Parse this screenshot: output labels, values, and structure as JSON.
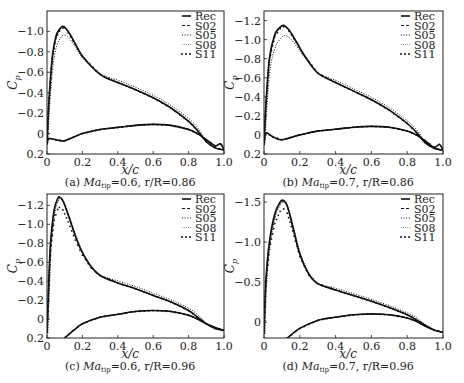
{
  "figure": {
    "panels": [
      {
        "id": "a",
        "caption_prefix": "(a) ",
        "caption_ma": "Ma",
        "caption_sub": "tip",
        "caption_rest": "=0.6, r/R=0.86",
        "frame": {
          "x0": 47,
          "y0": 11,
          "x1": 224,
          "y1": 154
        },
        "ylim": [
          0.2,
          -1.2
        ],
        "yticks": [
          -1.0,
          -0.8,
          -0.6,
          -0.4,
          -0.2,
          0,
          0.2
        ],
        "ytick_labels": [
          "−1.0",
          "−0.8",
          "−0.6",
          "−0.4",
          "−0.2",
          "0",
          "0.2"
        ]
      },
      {
        "id": "b",
        "caption_prefix": "(b) ",
        "caption_ma": "Ma",
        "caption_sub": "tip",
        "caption_rest": "=0.7, r/R=0.86",
        "frame": {
          "x0": 264,
          "y0": 11,
          "x1": 443,
          "y1": 154
        },
        "ylim": [
          0.2,
          -1.3
        ],
        "yticks": [
          -1.2,
          -1.0,
          -0.8,
          -0.6,
          -0.4,
          -0.2,
          0,
          0.2
        ],
        "ytick_labels": [
          "−1.2",
          "−1.0",
          "−0.8",
          "−0.6",
          "−0.4",
          "−0.2",
          "0",
          "0.2"
        ]
      },
      {
        "id": "c",
        "caption_prefix": "(c) ",
        "caption_ma": "Ma",
        "caption_sub": "tip",
        "caption_rest": "=0.6, r/R=0.96",
        "frame": {
          "x0": 47,
          "y0": 194,
          "x1": 224,
          "y1": 338
        },
        "ylim": [
          0.2,
          -1.32
        ],
        "yticks": [
          -1.2,
          -1.0,
          -0.8,
          -0.6,
          -0.4,
          -0.2,
          0,
          0.2
        ],
        "ytick_labels": [
          "−1.2",
          "−1.0",
          "−0.8",
          "−0.6",
          "−0.4",
          "−0.2",
          "0",
          "0.2"
        ]
      },
      {
        "id": "d",
        "caption_prefix": "(d) ",
        "caption_ma": "Ma",
        "caption_sub": "tip",
        "caption_rest": "=0.7, r/R=0.96",
        "frame": {
          "x0": 264,
          "y0": 194,
          "x1": 443,
          "y1": 338
        },
        "ylim": [
          0.2,
          -1.6
        ],
        "yticks": [
          -1.5,
          -1.0,
          -0.5,
          0
        ],
        "ytick_labels": [
          "−1.5",
          "−1.0",
          "−0.5",
          "0"
        ]
      }
    ],
    "xticks": [
      0,
      0.2,
      0.4,
      0.6,
      0.8,
      1.0
    ],
    "xtick_labels": [
      "0",
      "0.2",
      "0.4",
      "0.6",
      "0.8",
      "1.0"
    ],
    "xlabel": "x/c",
    "ylabel_main": "C",
    "ylabel_sub": "p",
    "legend": [
      "Rec",
      "S02",
      "S05",
      "S08",
      "S11"
    ]
  },
  "chart_data": [
    {
      "type": "line",
      "title": "(a) Ma_tip=0.6, r/R=0.86",
      "xlabel": "x/c",
      "ylabel": "C_p",
      "xlim": [
        0,
        1.0
      ],
      "ylim": [
        0.2,
        -1.2
      ],
      "y_inverted": true,
      "grid": false,
      "legend_position": "upper right",
      "legend": [
        "Rec",
        "S02",
        "S05",
        "S08",
        "S11"
      ],
      "series": [
        {
          "name": "Rec",
          "style": "solid",
          "suction_side": {
            "x": [
              0,
              0.01,
              0.03,
              0.05,
              0.07,
              0.09,
              0.12,
              0.16,
              0.2,
              0.3,
              0.4,
              0.5,
              0.6,
              0.7,
              0.8,
              0.85,
              0.9,
              0.95,
              1.0
            ],
            "y": [
              0.1,
              -0.3,
              -0.75,
              -0.95,
              -1.02,
              -1.05,
              -1.0,
              -0.88,
              -0.76,
              -0.58,
              -0.5,
              -0.43,
              -0.35,
              -0.25,
              -0.12,
              -0.03,
              0.08,
              0.14,
              0.16
            ]
          },
          "pressure_side": {
            "x": [
              0,
              0.01,
              0.05,
              0.1,
              0.2,
              0.3,
              0.4,
              0.5,
              0.6,
              0.7,
              0.8,
              0.85,
              0.9,
              0.95,
              0.98,
              1.0
            ],
            "y": [
              0.1,
              0.05,
              0.06,
              0.07,
              0.0,
              -0.04,
              -0.06,
              -0.08,
              -0.09,
              -0.08,
              -0.04,
              0.0,
              0.06,
              0.12,
              0.1,
              0.16
            ]
          }
        },
        {
          "name": "S02",
          "style": "dashed",
          "peak_cp": -1.04
        },
        {
          "name": "S05",
          "style": "dotted",
          "peak_cp": -0.95
        },
        {
          "name": "S08",
          "style": "fine-dotted",
          "peak_cp": -1.04
        },
        {
          "name": "S11",
          "style": "dot-markers",
          "peak_cp": -1.03
        }
      ]
    },
    {
      "type": "line",
      "title": "(b) Ma_tip=0.7, r/R=0.86",
      "xlabel": "x/c",
      "ylabel": "C_p",
      "xlim": [
        0,
        1.0
      ],
      "ylim": [
        0.2,
        -1.3
      ],
      "y_inverted": true,
      "grid": false,
      "legend_position": "upper right",
      "legend": [
        "Rec",
        "S02",
        "S05",
        "S08",
        "S11"
      ],
      "series": [
        {
          "name": "Rec",
          "style": "solid",
          "suction_side": {
            "x": [
              0,
              0.01,
              0.03,
              0.06,
              0.09,
              0.11,
              0.14,
              0.18,
              0.22,
              0.3,
              0.4,
              0.5,
              0.6,
              0.7,
              0.8,
              0.85,
              0.9,
              0.95,
              1.0
            ],
            "y": [
              0.1,
              -0.3,
              -0.8,
              -1.05,
              -1.13,
              -1.15,
              -1.1,
              -0.98,
              -0.85,
              -0.65,
              -0.55,
              -0.46,
              -0.37,
              -0.26,
              -0.12,
              -0.03,
              0.08,
              0.14,
              0.16
            ]
          },
          "pressure_side": {
            "x": [
              0,
              0.01,
              0.05,
              0.1,
              0.2,
              0.3,
              0.4,
              0.5,
              0.6,
              0.7,
              0.8,
              0.85,
              0.9,
              0.95,
              0.98,
              1.0
            ],
            "y": [
              0.1,
              -0.02,
              0.02,
              0.05,
              0.0,
              -0.04,
              -0.06,
              -0.08,
              -0.09,
              -0.08,
              -0.04,
              0.0,
              0.06,
              0.13,
              0.1,
              0.16
            ]
          }
        },
        {
          "name": "S02",
          "style": "dashed",
          "peak_cp": -1.14
        },
        {
          "name": "S05",
          "style": "dotted",
          "peak_cp": -1.01
        },
        {
          "name": "S08",
          "style": "fine-dotted",
          "peak_cp": -1.14
        },
        {
          "name": "S11",
          "style": "dot-markers",
          "peak_cp": -1.13
        }
      ]
    },
    {
      "type": "line",
      "title": "(c) Ma_tip=0.6, r/R=0.96",
      "xlabel": "x/c",
      "ylabel": "C_p",
      "xlim": [
        0,
        1.0
      ],
      "ylim": [
        0.2,
        -1.32
      ],
      "y_inverted": true,
      "grid": false,
      "legend_position": "upper right",
      "legend": [
        "Rec",
        "S02",
        "S05",
        "S08",
        "S11"
      ],
      "series": [
        {
          "name": "Rec",
          "style": "solid",
          "suction_side": {
            "x": [
              0,
              0.01,
              0.02,
              0.04,
              0.06,
              0.07,
              0.09,
              0.12,
              0.16,
              0.2,
              0.25,
              0.3,
              0.4,
              0.5,
              0.6,
              0.7,
              0.8,
              0.85,
              0.9,
              0.95,
              1.0
            ],
            "y": [
              0.15,
              -0.4,
              -0.8,
              -1.15,
              -1.27,
              -1.29,
              -1.25,
              -1.1,
              -0.88,
              -0.7,
              -0.55,
              -0.46,
              -0.38,
              -0.32,
              -0.25,
              -0.18,
              -0.09,
              -0.02,
              0.05,
              0.1,
              0.12
            ]
          },
          "pressure_side": {
            "x": [
              0.1,
              0.15,
              0.2,
              0.3,
              0.4,
              0.5,
              0.6,
              0.7,
              0.8,
              0.85,
              0.9,
              0.95,
              1.0
            ],
            "y": [
              0.2,
              0.12,
              0.05,
              -0.02,
              -0.05,
              -0.08,
              -0.09,
              -0.08,
              -0.04,
              0.0,
              0.05,
              0.09,
              0.12
            ]
          }
        },
        {
          "name": "S02",
          "style": "dashed",
          "peak_cp": -1.28
        },
        {
          "name": "S05",
          "style": "dotted",
          "peak_cp": -1.27
        },
        {
          "name": "S08",
          "style": "fine-dotted",
          "peak_cp": -1.27
        },
        {
          "name": "S11",
          "style": "dot-markers",
          "peak_cp": -1.17
        }
      ]
    },
    {
      "type": "line",
      "title": "(d) Ma_tip=0.7, r/R=0.96",
      "xlabel": "x/c",
      "ylabel": "C_p",
      "xlim": [
        0,
        1.0
      ],
      "ylim": [
        0.2,
        -1.6
      ],
      "y_inverted": true,
      "grid": false,
      "legend_position": "upper right",
      "legend": [
        "Rec",
        "S02",
        "S05",
        "S08",
        "S11"
      ],
      "series": [
        {
          "name": "Rec",
          "style": "solid",
          "suction_side": {
            "x": [
              0,
              0.01,
              0.03,
              0.06,
              0.09,
              0.11,
              0.13,
              0.16,
              0.2,
              0.25,
              0.3,
              0.4,
              0.5,
              0.6,
              0.7,
              0.8,
              0.85,
              0.9,
              0.95,
              1.0
            ],
            "y": [
              0.15,
              -0.5,
              -1.0,
              -1.35,
              -1.5,
              -1.52,
              -1.45,
              -1.2,
              -0.85,
              -0.6,
              -0.48,
              -0.4,
              -0.33,
              -0.26,
              -0.18,
              -0.09,
              -0.03,
              0.04,
              0.1,
              0.13
            ]
          },
          "pressure_side": {
            "x": [
              0.13,
              0.2,
              0.3,
              0.4,
              0.5,
              0.6,
              0.7,
              0.8,
              0.85,
              0.9,
              0.95,
              1.0
            ],
            "y": [
              0.2,
              0.08,
              -0.02,
              -0.06,
              -0.09,
              -0.1,
              -0.09,
              -0.05,
              -0.01,
              0.05,
              0.1,
              0.13
            ]
          }
        },
        {
          "name": "S02",
          "style": "dashed",
          "peak_cp": -1.5
        },
        {
          "name": "S05",
          "style": "dotted",
          "peak_cp": -1.49
        },
        {
          "name": "S08",
          "style": "fine-dotted",
          "peak_cp": -1.5
        },
        {
          "name": "S11",
          "style": "dot-markers",
          "peak_cp": -1.38
        }
      ]
    }
  ]
}
